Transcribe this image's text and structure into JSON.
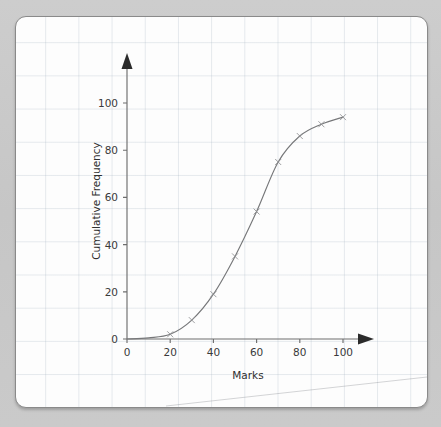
{
  "card": {
    "background_color": "#fdfdfd",
    "border_color": "#8a8a8a",
    "page_background_color": "#c9c9c9",
    "grid_line_color": "#a0afbe"
  },
  "chart_data": {
    "type": "line",
    "title": "",
    "subtitle": "",
    "xlabel": "Marks",
    "ylabel": "Cumulative Frequency",
    "xlim": [
      0,
      110
    ],
    "ylim": [
      0,
      108
    ],
    "xticks": [
      0,
      20,
      40,
      60,
      80,
      100
    ],
    "xtick_labels": [
      "0",
      "20",
      "40",
      "60",
      "80",
      "100"
    ],
    "yticks": [
      0,
      20,
      40,
      60,
      80,
      100
    ],
    "ytick_labels": [
      "0",
      "20",
      "40",
      "60",
      "80",
      "100"
    ],
    "grid": true,
    "legend": false,
    "legend_position": "none",
    "axis_arrows": true,
    "marker": "x",
    "line_color": "#77787a",
    "series": [
      {
        "name": "Cumulative frequency",
        "x": [
          0,
          10,
          20,
          30,
          40,
          50,
          60,
          70,
          80,
          90,
          100
        ],
        "values": [
          0,
          0.5,
          2,
          8,
          19,
          35,
          54,
          75,
          86,
          91,
          94
        ]
      }
    ],
    "annotations": []
  },
  "axis_labels": {
    "x_title": "Marks",
    "y_title": "Cumulative Frequency"
  }
}
